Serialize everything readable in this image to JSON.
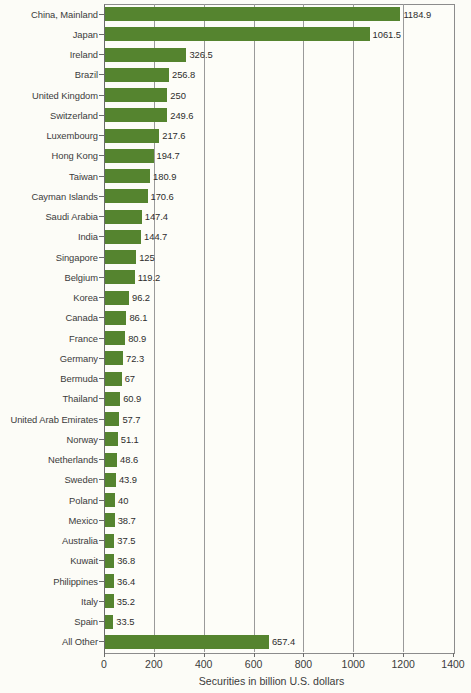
{
  "chart_data": {
    "type": "bar",
    "orientation": "horizontal",
    "title": "",
    "xlabel": "Securities in billion U.S. dollars",
    "ylabel": "",
    "xlim": [
      0,
      1400
    ],
    "xticks": [
      0,
      200,
      400,
      600,
      800,
      1000,
      1200,
      1400
    ],
    "xtick_labels": [
      "0",
      "200",
      "400",
      "600",
      "800",
      "1000",
      "1200",
      "1400"
    ],
    "grid": true,
    "legend": null,
    "bar_color": "#55842F",
    "categories": [
      "China, Mainland",
      "Japan",
      "Ireland",
      "Brazil",
      "United Kingdom",
      "Switzerland",
      "Luxembourg",
      "Hong Kong",
      "Taiwan",
      "Cayman Islands",
      "Saudi Arabia",
      "India",
      "Singapore",
      "Belgium",
      "Korea",
      "Canada",
      "France",
      "Germany",
      "Bermuda",
      "Thailand",
      "United Arab Emirates",
      "Norway",
      "Netherlands",
      "Sweden",
      "Poland",
      "Mexico",
      "Australia",
      "Kuwait",
      "Philippines",
      "Italy",
      "Spain",
      "All Other"
    ],
    "values": [
      1184.9,
      1061.5,
      326.5,
      256.8,
      250,
      249.6,
      217.6,
      194.7,
      180.9,
      170.6,
      147.4,
      144.7,
      125,
      119.2,
      96.2,
      86.1,
      80.9,
      72.3,
      67,
      60.9,
      57.7,
      51.1,
      48.6,
      43.9,
      40,
      38.7,
      37.5,
      36.8,
      36.4,
      35.2,
      33.5,
      657.4
    ],
    "value_labels": [
      "1184.9",
      "1061.5",
      "326.5",
      "256.8",
      "250",
      "249.6",
      "217.6",
      "194.7",
      "180.9",
      "170.6",
      "147.4",
      "144.7",
      "125",
      "119.2",
      "96.2",
      "86.1",
      "80.9",
      "72.3",
      "67",
      "60.9",
      "57.7",
      "51.1",
      "48.6",
      "43.9",
      "40",
      "38.7",
      "37.5",
      "36.8",
      "36.4",
      "35.2",
      "33.5",
      "657.4"
    ]
  }
}
